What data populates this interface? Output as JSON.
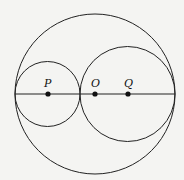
{
  "diagram": {
    "points": [
      {
        "label": "P",
        "x": 48,
        "y": 94
      },
      {
        "label": "O",
        "x": 95,
        "y": 94
      },
      {
        "label": "Q",
        "x": 128,
        "y": 94
      }
    ],
    "circles": [
      {
        "name": "outer",
        "cx": 95,
        "cy": 94,
        "r": 80
      },
      {
        "name": "circle-p",
        "cx": 47.5,
        "cy": 94,
        "r": 33
      },
      {
        "name": "circle-q",
        "cx": 127.5,
        "cy": 94,
        "r": 47
      }
    ],
    "diameter": {
      "x1": 15,
      "x2": 175,
      "y": 94
    },
    "colors": {
      "stroke": "#222222",
      "background": "#f4f4f2"
    }
  }
}
